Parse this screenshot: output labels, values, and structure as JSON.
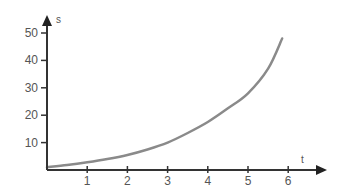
{
  "chart_data": {
    "type": "line",
    "title": "",
    "xlabel": "t",
    "ylabel": "s",
    "x_ticks": [
      "1",
      "2",
      "3",
      "4",
      "5",
      "6"
    ],
    "y_ticks": [
      "10",
      "20",
      "30",
      "40",
      "50"
    ],
    "xlim": [
      0,
      6.9
    ],
    "ylim": [
      0,
      55
    ],
    "grid": false,
    "legend": null,
    "series": [
      {
        "name": "s(t)",
        "x": [
          0,
          0.5,
          1,
          1.5,
          2,
          2.5,
          3,
          3.5,
          4,
          4.5,
          5,
          5.5,
          5.85
        ],
        "values": [
          1,
          1.8,
          2.8,
          4,
          5.5,
          7.5,
          10,
          13.5,
          17.5,
          22.5,
          28,
          37,
          48
        ]
      }
    ],
    "colors": {
      "axis": "#333333",
      "curve": "#8a8a8a",
      "text": "#555555"
    }
  }
}
